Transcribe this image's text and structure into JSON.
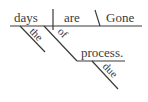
{
  "diagram": {
    "type": "sentence-diagram",
    "sentence": "Gone are the days of due process.",
    "baseline": {
      "subject": "days",
      "predicate": "are",
      "complement": "Gone"
    },
    "modifiers": {
      "article": "the",
      "preposition": "of",
      "object": "process.",
      "adjective": "due"
    }
  }
}
